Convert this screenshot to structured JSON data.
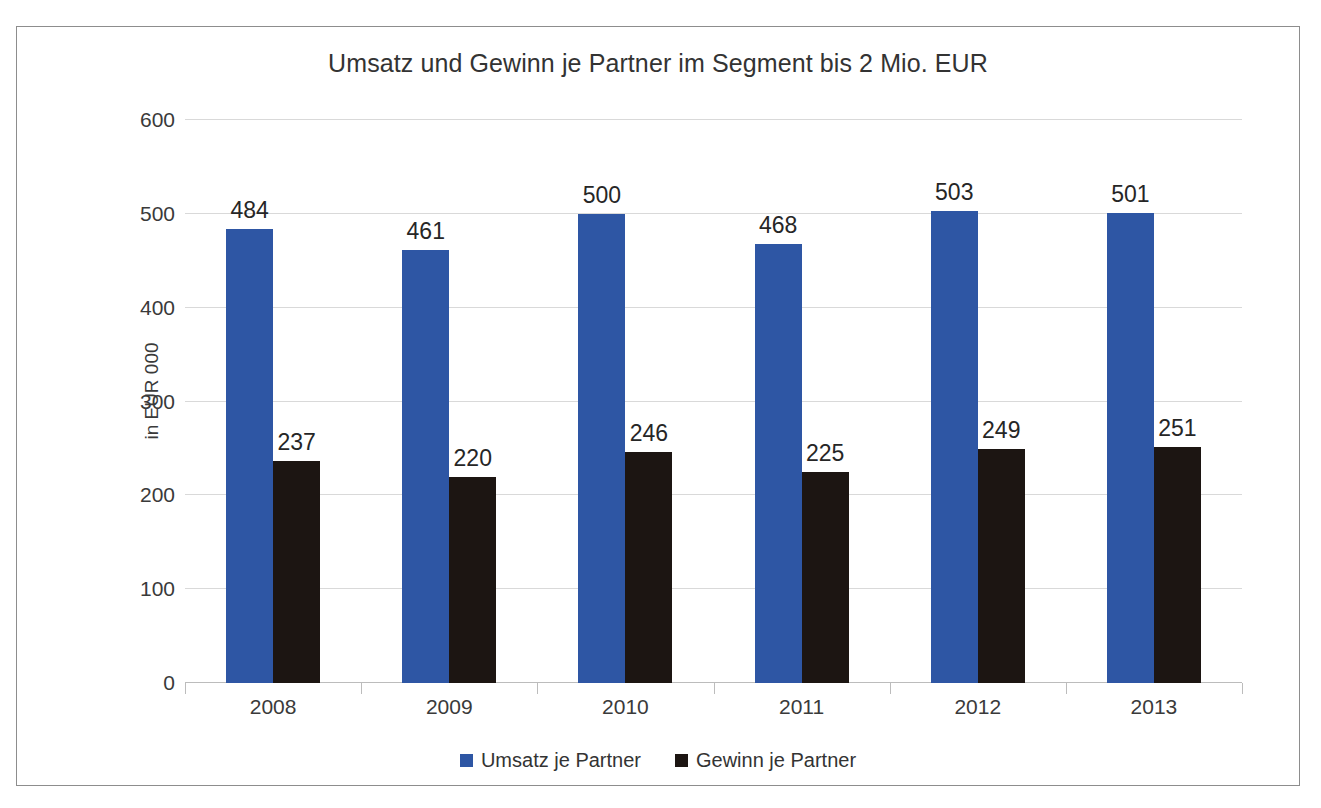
{
  "chart_data": {
    "type": "bar",
    "title": "Umsatz und Gewinn je Partner im Segment bis 2 Mio. EUR",
    "xlabel": "",
    "ylabel": "in EUR 000",
    "categories": [
      "2008",
      "2009",
      "2010",
      "2011",
      "2012",
      "2013"
    ],
    "series": [
      {
        "name": "Umsatz je Partner",
        "color": "#2e56a4",
        "values": [
          484,
          461,
          500,
          468,
          503,
          501
        ]
      },
      {
        "name": "Gewinn je Partner",
        "color": "#1c1512",
        "values": [
          237,
          220,
          246,
          225,
          249,
          251
        ]
      }
    ],
    "ylim": [
      0,
      600
    ],
    "yticks": [
      0,
      100,
      200,
      300,
      400,
      500,
      600
    ],
    "ytick_labels": [
      "0",
      "100",
      "200",
      "300",
      "400",
      "500",
      "600"
    ],
    "grid": true,
    "legend_position": "bottom",
    "data_labels": true
  },
  "axes": {
    "y_title": "in EUR 000"
  },
  "legend": {
    "items": [
      {
        "label": "Umsatz je Partner",
        "swatch": "revenue"
      },
      {
        "label": "Gewinn je Partner",
        "swatch": "profit"
      }
    ]
  }
}
